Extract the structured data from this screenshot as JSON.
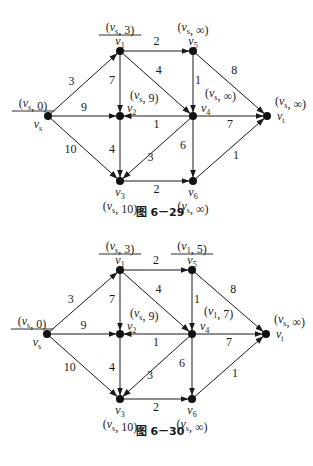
{
  "figures": [
    {
      "caption": "图 6－29",
      "nodes": {
        "vs": {
          "name": "v_s",
          "label": "(v_s, 0)",
          "underlined": true
        },
        "v1": {
          "name": "v_1",
          "label": "(v_s, 3)",
          "underlined": true
        },
        "v2": {
          "name": "v_2",
          "label": "(v_s, 9)",
          "underlined": false
        },
        "v3": {
          "name": "v_3",
          "label": "(v_s, 10)",
          "underlined": false
        },
        "v4": {
          "name": "v_4",
          "label": "(v_s, ∞)",
          "underlined": false
        },
        "v5": {
          "name": "v_5",
          "label": "(v_s, ∞)",
          "underlined": false
        },
        "v6": {
          "name": "v_6",
          "label": "(v_s, ∞)",
          "underlined": false
        },
        "vt": {
          "name": "v_t",
          "label": "(v_s, ∞)",
          "underlined": false
        }
      },
      "edges": [
        {
          "from": "vs",
          "to": "v1",
          "weight": "3"
        },
        {
          "from": "vs",
          "to": "v2",
          "weight": "9"
        },
        {
          "from": "vs",
          "to": "v3",
          "weight": "10"
        },
        {
          "from": "v1",
          "to": "v5",
          "weight": "2"
        },
        {
          "from": "v1",
          "to": "v2",
          "weight": "7"
        },
        {
          "from": "v1",
          "to": "v4",
          "weight": "4"
        },
        {
          "from": "v4",
          "to": "v2",
          "weight": "1"
        },
        {
          "from": "v2",
          "to": "v3",
          "weight": "4"
        },
        {
          "from": "v4",
          "to": "v3",
          "weight": "3"
        },
        {
          "from": "v5",
          "to": "v4",
          "weight": "1"
        },
        {
          "from": "v5",
          "to": "vt",
          "weight": "8"
        },
        {
          "from": "v4",
          "to": "vt",
          "weight": "7"
        },
        {
          "from": "v4",
          "to": "v6",
          "weight": "6"
        },
        {
          "from": "v3",
          "to": "v6",
          "weight": "2"
        },
        {
          "from": "v6",
          "to": "vt",
          "weight": "1"
        }
      ]
    },
    {
      "caption": "图 6－30",
      "nodes": {
        "vs": {
          "name": "v_s",
          "label": "(v_s, 0)",
          "underlined": true
        },
        "v1": {
          "name": "v_1",
          "label": "(v_s, 3)",
          "underlined": true
        },
        "v2": {
          "name": "v_2",
          "label": "(v_s, 9)",
          "underlined": false
        },
        "v3": {
          "name": "v_3",
          "label": "(v_s, 10)",
          "underlined": false
        },
        "v4": {
          "name": "v_4",
          "label": "(v_1, 7)",
          "underlined": false
        },
        "v5": {
          "name": "v_5",
          "label": "(v_1, 5)",
          "underlined": true
        },
        "v6": {
          "name": "v_6",
          "label": "(v_s, ∞)",
          "underlined": false
        },
        "vt": {
          "name": "v_t",
          "label": "(v_s, ∞)",
          "underlined": false
        }
      },
      "edges": [
        {
          "from": "vs",
          "to": "v1",
          "weight": "3"
        },
        {
          "from": "vs",
          "to": "v2",
          "weight": "9"
        },
        {
          "from": "vs",
          "to": "v3",
          "weight": "10"
        },
        {
          "from": "v1",
          "to": "v5",
          "weight": "2"
        },
        {
          "from": "v1",
          "to": "v2",
          "weight": "7"
        },
        {
          "from": "v1",
          "to": "v4",
          "weight": "4"
        },
        {
          "from": "v4",
          "to": "v2",
          "weight": "1"
        },
        {
          "from": "v2",
          "to": "v3",
          "weight": "4"
        },
        {
          "from": "v4",
          "to": "v3",
          "weight": "3"
        },
        {
          "from": "v5",
          "to": "v4",
          "weight": "1"
        },
        {
          "from": "v5",
          "to": "vt",
          "weight": "8"
        },
        {
          "from": "v4",
          "to": "vt",
          "weight": "7"
        },
        {
          "from": "v4",
          "to": "v6",
          "weight": "6"
        },
        {
          "from": "v3",
          "to": "v6",
          "weight": "2"
        },
        {
          "from": "v6",
          "to": "vt",
          "weight": "1"
        }
      ]
    }
  ]
}
